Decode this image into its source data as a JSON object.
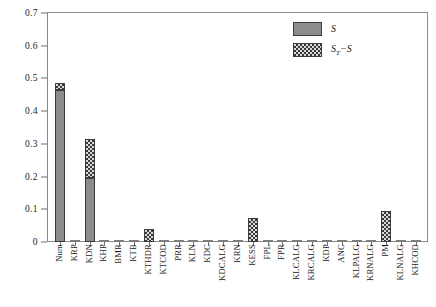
{
  "chart_data": {
    "type": "bar",
    "subtype": "stacked-vertical",
    "title": "",
    "xlabel": "",
    "ylabel": "",
    "ylim": [
      0,
      0.7
    ],
    "y_ticks": [
      "0",
      "0.1",
      "0.2",
      "0.3",
      "0.4",
      "0.5",
      "0.6",
      "0.7"
    ],
    "y_tick_values": [
      0,
      0.1,
      0.2,
      0.3,
      0.4,
      0.5,
      0.6,
      0.7
    ],
    "grid": false,
    "legend_position": "top-right",
    "categories": [
      "Num",
      "KRP",
      "KDN",
      "KHP",
      "BMR",
      "KTB",
      "KTHDR",
      "KTCOD",
      "PRR",
      "KLN",
      "KDC",
      "KDCALG",
      "KRN",
      "KESS",
      "FPL",
      "FPR",
      "KLCALG",
      "KRCALG",
      "KDP",
      "ANC",
      "KLPALG",
      "KRNALG",
      "PM",
      "KLNALG",
      "KHCOD"
    ],
    "series": [
      {
        "name": "S",
        "legend_label": "S",
        "pattern": "solid-gray",
        "color": "#8c8c8c",
        "values": [
          0.465,
          0.0,
          0.197,
          0.0,
          0.0,
          0.0,
          0.0,
          0.0,
          0.0,
          0.0,
          0.0,
          0.0,
          0.0,
          0.0,
          0.0,
          0.0,
          0.0,
          0.0,
          0.0,
          0.0,
          0.0,
          0.0,
          0.0,
          0.0,
          0.0
        ]
      },
      {
        "name": "ST-S",
        "legend_label": "S",
        "legend_sub": "T",
        "legend_suffix": "−S",
        "pattern": "checkered",
        "color": "#3a3a3a",
        "values": [
          0.022,
          0.0,
          0.118,
          0.0,
          0.0,
          0.0,
          0.039,
          0.0,
          0.0,
          0.0,
          0.0,
          0.0,
          0.0,
          0.073,
          0.0,
          0.0,
          0.0,
          0.0,
          0.0,
          0.0,
          0.0,
          0.0,
          0.094,
          0.0,
          0.0
        ]
      }
    ],
    "totals": [
      0.487,
      0.0,
      0.315,
      0.0,
      0.0,
      0.0,
      0.039,
      0.0,
      0.0,
      0.0,
      0.0,
      0.0,
      0.0,
      0.073,
      0.0,
      0.0,
      0.0,
      0.0,
      0.0,
      0.0,
      0.0,
      0.0,
      0.094,
      0.0,
      0.0
    ]
  },
  "legend": {
    "items": [
      {
        "label": "S",
        "sub": "",
        "suffix": ""
      },
      {
        "label": "S",
        "sub": "T",
        "suffix": "−S"
      }
    ]
  }
}
